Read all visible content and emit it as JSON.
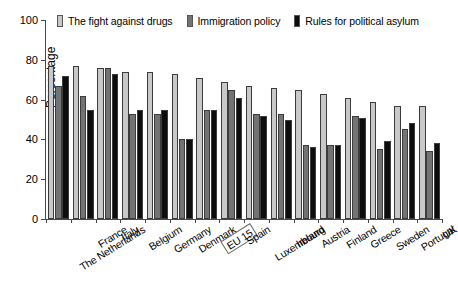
{
  "chart_data": {
    "type": "bar",
    "title": "",
    "xlabel": "",
    "ylabel": "Percentage",
    "ylim": [
      0,
      100
    ],
    "yticks": [
      0,
      20,
      40,
      60,
      80,
      100
    ],
    "grid": false,
    "legend_position": "top",
    "categories": [
      "The Netherlands",
      "France",
      "Italy",
      "Belgium",
      "Germany",
      "Denmark",
      "EU 15",
      "Spain",
      "Luxembourg",
      "Ireland",
      "Austria",
      "Finland",
      "Greece",
      "Sweden",
      "Portugal",
      "UK"
    ],
    "highlighted_category": "EU 15",
    "series": [
      {
        "name": "The fight against drugs",
        "color": "#c8c8c8",
        "values": [
          77,
          77,
          76,
          74,
          74,
          73,
          71,
          69,
          67,
          66,
          65,
          63,
          61,
          59,
          57,
          57
        ]
      },
      {
        "name": "Immigration policy",
        "color": "#737373",
        "values": [
          67,
          62,
          76,
          53,
          53,
          40,
          55,
          65,
          53,
          53,
          37,
          37,
          52,
          35,
          45,
          34
        ]
      },
      {
        "name": "Rules for political asylum",
        "color": "#0d0d0d",
        "values": [
          72,
          55,
          73,
          55,
          55,
          40,
          55,
          61,
          52,
          50,
          36,
          37,
          51,
          39,
          48,
          38
        ]
      }
    ]
  }
}
